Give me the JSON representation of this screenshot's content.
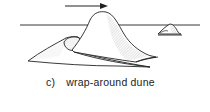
{
  "figure": {
    "caption_label": "c)",
    "caption_text": "wrap-around dune",
    "wind_direction": "left-to-right",
    "colors": {
      "line": "#222222",
      "background": "#ffffff",
      "shade": "#9a9a9a"
    },
    "elements": [
      {
        "name": "wind-direction-arrow",
        "description": "arrow pointing right above dune"
      },
      {
        "name": "ground-surface-line",
        "description": "horizon line"
      },
      {
        "name": "wrap-around-dune",
        "description": "main dune with arms wrapping around"
      },
      {
        "name": "small-dune",
        "description": "small dune to the right"
      }
    ]
  }
}
